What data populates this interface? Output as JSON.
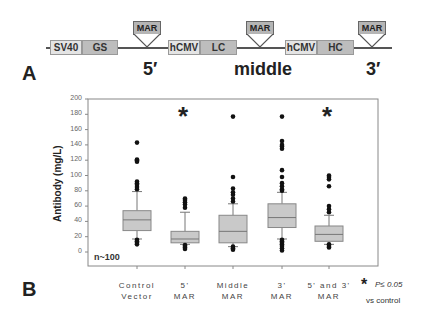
{
  "panel_a": {
    "label": "A",
    "elements": [
      {
        "name": "SV40",
        "style": "light"
      },
      {
        "name": "GS",
        "style": "dark"
      },
      {
        "name": "hCMV",
        "style": "light"
      },
      {
        "name": "LC",
        "style": "dark"
      },
      {
        "name": "hCMV",
        "style": "light"
      },
      {
        "name": "HC",
        "style": "dark"
      }
    ],
    "mar_label": "MAR",
    "positions": [
      "5′",
      "middle",
      "3′"
    ]
  },
  "panel_b": {
    "label": "B",
    "n_label": "n~100",
    "significance_symbol": "*",
    "significance_text": "P≤ 0.05",
    "significance_note": "vs control"
  },
  "chart_data": {
    "type": "box",
    "title": "",
    "xlabel": "",
    "ylabel": "Antibody (mg/L)",
    "ylim": [
      0,
      200
    ],
    "yticks": [
      0,
      20,
      40,
      60,
      80,
      100,
      120,
      140,
      160,
      180,
      200
    ],
    "grid": false,
    "categories": [
      [
        "Control",
        "Vector"
      ],
      [
        "5'",
        "MAR"
      ],
      [
        "Middle",
        "MAR"
      ],
      [
        "3'",
        "MAR"
      ],
      [
        "5' and 3'",
        "MAR"
      ]
    ],
    "boxes": [
      {
        "q1": 28,
        "median": 42,
        "q3": 54,
        "whisker_low": 17,
        "whisker_high": 79,
        "outliers": [
          10,
          12,
          14,
          16,
          82,
          85,
          88,
          90,
          92,
          118,
          120,
          121,
          143
        ],
        "significant": false
      },
      {
        "q1": 12,
        "median": 17,
        "q3": 27,
        "whisker_low": 10,
        "whisker_high": 52,
        "outliers": [
          4,
          6,
          8,
          9,
          58,
          62,
          65,
          68,
          70
        ],
        "significant": true
      },
      {
        "q1": 12,
        "median": 27,
        "q3": 48,
        "whisker_low": 7,
        "whisker_high": 63,
        "outliers": [
          3,
          5,
          7,
          66,
          70,
          75,
          78,
          83,
          98,
          177
        ],
        "significant": false
      },
      {
        "q1": 32,
        "median": 45,
        "q3": 63,
        "whisker_low": 17,
        "whisker_high": 78,
        "outliers": [
          2,
          5,
          8,
          10,
          12,
          14,
          16,
          80,
          82,
          86,
          90,
          98,
          107,
          135,
          138,
          140,
          145,
          177
        ],
        "significant": false
      },
      {
        "q1": 14,
        "median": 23,
        "q3": 34,
        "whisker_low": 10,
        "whisker_high": 48,
        "outliers": [
          6,
          8,
          10,
          52,
          56,
          60,
          86,
          95,
          98,
          100
        ],
        "significant": true
      }
    ],
    "annotations": [
      "n~100",
      "* P≤ 0.05 vs control"
    ]
  }
}
